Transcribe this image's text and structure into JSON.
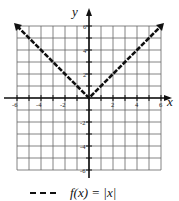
{
  "chart_data": {
    "type": "line",
    "title": "",
    "xlabel": "x",
    "ylabel": "y",
    "xlim": [
      -6,
      6
    ],
    "ylim": [
      -6,
      6
    ],
    "grid": true,
    "x_ticks": [
      -6,
      -4,
      -2,
      2,
      4,
      6
    ],
    "y_ticks": [
      6,
      4,
      2,
      -2,
      -4,
      -6
    ],
    "x_tick_labels": [
      "-6",
      "-4",
      "-2",
      "2",
      "4",
      "6"
    ],
    "y_tick_labels": [
      "6",
      "4",
      "2",
      "-2",
      "-4",
      "-6"
    ],
    "series": [
      {
        "name": "f(x) = |x|",
        "style": "dashed",
        "arrows": "both-ends",
        "x": [
          -6,
          -4,
          -2,
          0,
          2,
          4,
          6
        ],
        "y": [
          6,
          4,
          2,
          0,
          2,
          4,
          6
        ]
      }
    ],
    "legend": {
      "position": "bottom",
      "entries": [
        "f(x) = |x|"
      ]
    }
  },
  "axes": {
    "x_label": "x",
    "y_label": "y"
  },
  "legend": {
    "label": "f(x) = |x|"
  },
  "colors": {
    "ink": "#111111",
    "grid": "#555555"
  }
}
